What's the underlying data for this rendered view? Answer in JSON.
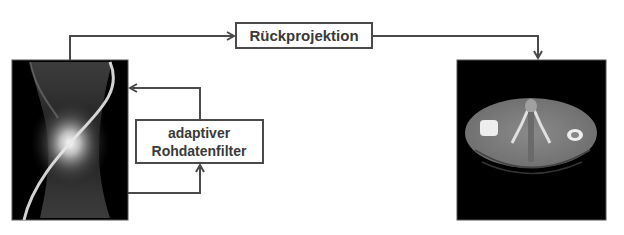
{
  "diagram": {
    "nodes": {
      "sinogram": {
        "label": "",
        "type": "image",
        "description": "sinogram (raw projection data)"
      },
      "backprojection": {
        "label": "Rückprojektion"
      },
      "filter": {
        "line1": "adaptiver",
        "line2": "Rohdatenfilter"
      },
      "ct_image": {
        "label": "",
        "type": "image",
        "description": "reconstructed axial CT slice (pelvis)"
      }
    },
    "edges": [
      {
        "from": "sinogram",
        "to": "backprojection"
      },
      {
        "from": "backprojection",
        "to": "ct_image"
      },
      {
        "from": "sinogram",
        "to": "filter"
      },
      {
        "from": "filter",
        "to": "sinogram"
      }
    ],
    "colors": {
      "line": "#4a4a4a",
      "box_border": "#4a4a4a",
      "text": "#3a3a3a",
      "image_bg": "#000000"
    }
  }
}
